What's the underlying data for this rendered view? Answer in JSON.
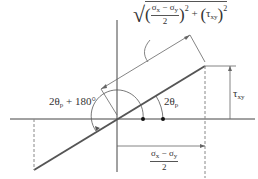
{
  "diagram": {
    "type": "mohr-circle-principal-angle-construction",
    "labels": {
      "hypotenuse": {
        "sqrt": "√",
        "numerator_a": "σ",
        "numerator_a_sub": "x",
        "minus": " − ",
        "numerator_b": "σ",
        "numerator_b_sub": "y",
        "denominator": "2",
        "squared": "2",
        "plus": " + ",
        "tau": "τ",
        "tau_sub": "xy",
        "tau_squared": "2"
      },
      "angle_small": {
        "prefix": "2θ",
        "sub": "p"
      },
      "angle_large": {
        "prefix": "2θ",
        "sub": "p",
        "suffix": " + 180°"
      },
      "tau_side": {
        "symbol": "τ",
        "sub": "xy"
      },
      "sigma_side": {
        "a": "σ",
        "a_sub": "x",
        "minus": " − ",
        "b": "σ",
        "b_sub": "y",
        "denominator": "2"
      }
    },
    "colors": {
      "axis": "#444444",
      "thick_line": "#555555",
      "thin_line": "#666666",
      "dashed": "#888888",
      "text": "#333333"
    }
  }
}
